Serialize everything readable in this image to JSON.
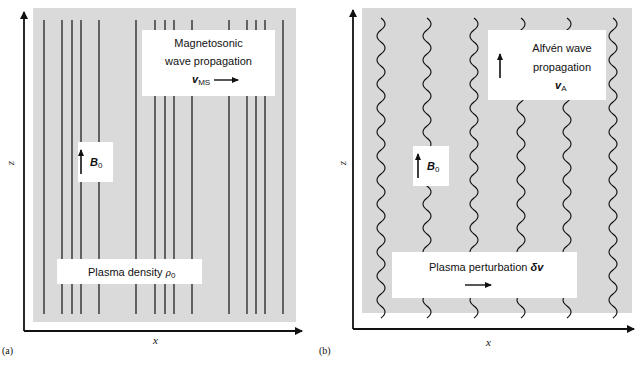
{
  "panels": [
    {
      "tag": "(a)",
      "x_axis_label": "x",
      "y_axis_label": "z",
      "field_label": {
        "symbol": "B",
        "subscript": "0"
      },
      "wave_box": {
        "line1": "Magnetosonic",
        "line2": "wave propagation",
        "velocity_symbol": "v",
        "velocity_subscript": "MS",
        "arrow_direction": "right"
      },
      "density_box": {
        "text": "Plasma density ",
        "symbol": "ρ",
        "subscript": "0"
      },
      "field_lines": {
        "style": "straight-vertical",
        "x_positions": [
          44,
          62,
          72,
          81,
          99,
          136,
          155,
          165,
          174,
          192,
          229,
          247,
          256,
          265,
          283
        ]
      }
    },
    {
      "tag": "(b)",
      "x_axis_label": "x",
      "y_axis_label": "z",
      "field_label": {
        "symbol": "B",
        "subscript": "0"
      },
      "wave_box": {
        "line1": "Alfvén wave",
        "line2": "propagation",
        "velocity_symbol": "v",
        "velocity_subscript": "A",
        "arrow_direction": "up"
      },
      "perturbation_box": {
        "text": "Plasma perturbation ",
        "symbol": "δv",
        "arrow_direction": "right"
      },
      "field_lines": {
        "style": "wavy-vertical",
        "x_positions": [
          381,
          427,
          474,
          521,
          567,
          613
        ]
      }
    }
  ],
  "colors": {
    "background": "#ffffff",
    "shaded_region": "#dcdcdc",
    "lines": "#111111",
    "label_box": "#ffffff"
  }
}
